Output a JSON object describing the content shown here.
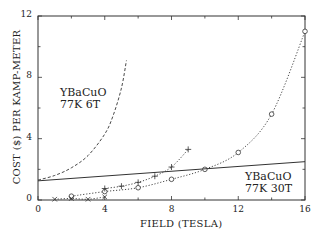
{
  "chart_data": {
    "type": "line",
    "title": "",
    "xlabel": "FIELD (TESLA)",
    "ylabel": "COST ($) PER KAMP-METER",
    "xlim": [
      0,
      16
    ],
    "ylim": [
      0,
      12
    ],
    "xticks": [
      0,
      4,
      8,
      12,
      16
    ],
    "yticks": [
      0,
      4,
      8,
      12
    ],
    "grid": false,
    "legend": null,
    "series": [
      {
        "name": "circles (dotted)",
        "marker": "o",
        "line": "dotted",
        "x": [
          2,
          4,
          6,
          8,
          10,
          12,
          14,
          16
        ],
        "y": [
          0.25,
          0.55,
          0.8,
          1.35,
          2.0,
          3.1,
          5.6,
          11.0
        ]
      },
      {
        "name": "plus (dotted)",
        "marker": "+",
        "line": "dotted",
        "x": [
          4,
          5,
          6,
          7,
          8,
          9
        ],
        "y": [
          0.75,
          0.9,
          1.15,
          1.55,
          2.15,
          3.3
        ]
      },
      {
        "name": "cross (dotted)",
        "marker": "x",
        "line": "dotted",
        "x": [
          1,
          2,
          3,
          4
        ],
        "y": [
          0.05,
          0.1,
          0.05,
          0.2
        ]
      },
      {
        "name": "YBaCuO 77K 30T",
        "marker": "none",
        "line": "solid",
        "x": [
          0,
          4,
          8,
          12,
          16
        ],
        "y": [
          1.25,
          1.5,
          1.8,
          2.15,
          2.5
        ]
      },
      {
        "name": "YBaCuO 77K 6T",
        "marker": "none",
        "line": "dashed",
        "x": [
          0,
          1,
          2,
          3,
          4,
          4.5,
          5,
          5.3
        ],
        "y": [
          1.3,
          1.6,
          2.1,
          2.9,
          4.3,
          5.5,
          7.3,
          9.1
        ]
      }
    ],
    "annotations": [
      {
        "text": [
          "YBaCuO",
          "77K 6T"
        ],
        "x": 1.3,
        "y": 7.0
      },
      {
        "text": [
          "YBaCuO",
          "77K 30T"
        ],
        "x": 12.3,
        "y": 2.0
      }
    ]
  },
  "labels": {
    "xlabel": "FIELD (TESLA)",
    "ylabel": "COST ($) PER KAMP-METER",
    "annot_6t_line1": "YBaCuO",
    "annot_6t_line2": "77K 6T",
    "annot_30t_line1": "YBaCuO",
    "annot_30t_line2": "77K 30T"
  }
}
